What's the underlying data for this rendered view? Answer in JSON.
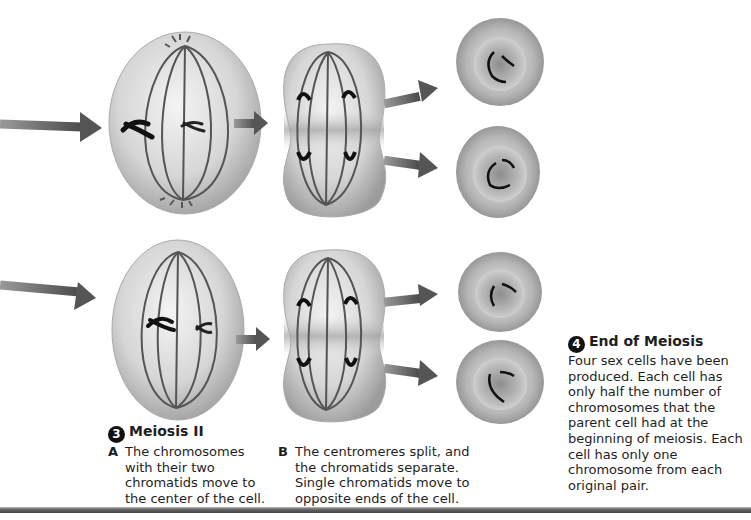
{
  "figure": {
    "step3": {
      "number": "3",
      "title": "Meiosis II",
      "items": [
        {
          "letter": "A",
          "text": "The chromosomes with their two chromatids move to the center of the cell."
        },
        {
          "letter": "B",
          "text": "The centromeres split, and the chromatids separate. Single chromatids move to opposite ends of the cell."
        }
      ]
    },
    "step4": {
      "number": "4",
      "title": "End of Meiosis",
      "text": "Four sex cells have been produced. Each cell has only half the number of chromosomes that the parent cell had at the beginning of meiosis. Each cell has only one chromosome from each original pair."
    },
    "colors": {
      "arrow": "#5a5a5a",
      "cell_light": "#e8e8e8",
      "cell_dark": "#9a9a9a",
      "chromosome": "#1a1a1a",
      "spindle": "#555555"
    }
  }
}
